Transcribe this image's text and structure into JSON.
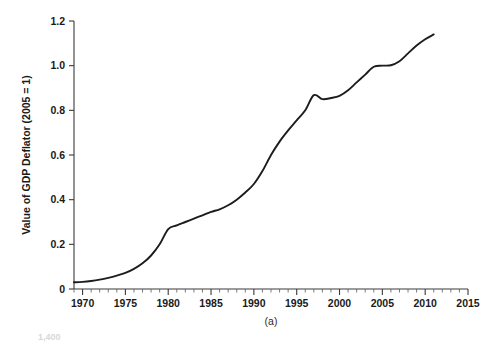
{
  "figure": {
    "panel_label": "(a)",
    "background_color": "#ffffff",
    "line_color": "#1c1c1c",
    "axis_color": "#3a3a3a",
    "partial_next_panel_tick": "1,400"
  },
  "chart_data": {
    "type": "line",
    "title": "",
    "subtitle": "",
    "xlabel": "",
    "ylabel": "Value of GDP Deflator (2005 = 1)",
    "xlim": [
      1969,
      2015
    ],
    "ylim": [
      0,
      1.2
    ],
    "grid": false,
    "legend": null,
    "x_ticks": [
      1970,
      1975,
      1980,
      1985,
      1990,
      1995,
      2000,
      2005,
      2010,
      2015
    ],
    "x_tick_labels": [
      "1970",
      "1975",
      "1980",
      "1985",
      "1990",
      "1995",
      "2000",
      "2005",
      "2010",
      "2015"
    ],
    "x_minor_tick_step": 1,
    "y_ticks": [
      0,
      0.2,
      0.4,
      0.6,
      0.8,
      1.0,
      1.2
    ],
    "y_tick_labels": [
      "0",
      "0.2",
      "0.4",
      "0.6",
      "0.8",
      "1.0",
      "1.2"
    ],
    "annotations": [
      "(a)"
    ],
    "series": [
      {
        "name": "GDP Deflator (2005 = 1)",
        "x": [
          1969,
          1970,
          1971,
          1972,
          1973,
          1974,
          1975,
          1976,
          1977,
          1978,
          1979,
          1980,
          1981,
          1982,
          1983,
          1984,
          1985,
          1986,
          1987,
          1988,
          1989,
          1990,
          1991,
          1992,
          1993,
          1994,
          1995,
          1996,
          1997,
          1998,
          1999,
          2000,
          2001,
          2002,
          2003,
          2004,
          2005,
          2006,
          2007,
          2008,
          2009,
          2010,
          2011
        ],
        "y": [
          0.03,
          0.032,
          0.036,
          0.042,
          0.05,
          0.06,
          0.072,
          0.09,
          0.115,
          0.15,
          0.2,
          0.268,
          0.285,
          0.3,
          0.315,
          0.33,
          0.345,
          0.357,
          0.375,
          0.4,
          0.432,
          0.47,
          0.528,
          0.6,
          0.66,
          0.71,
          0.755,
          0.8,
          0.868,
          0.85,
          0.855,
          0.865,
          0.89,
          0.925,
          0.96,
          0.995,
          1.0,
          1.002,
          1.02,
          1.055,
          1.09,
          1.118,
          1.14
        ]
      }
    ]
  }
}
